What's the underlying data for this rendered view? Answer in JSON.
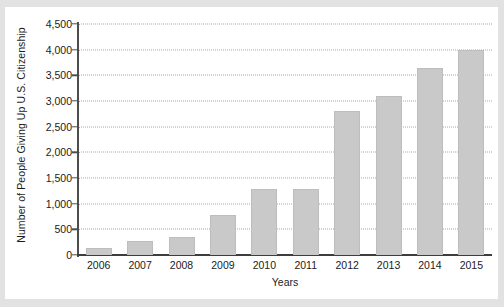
{
  "chart_data": {
    "type": "bar",
    "title": "",
    "xlabel": "Years",
    "ylabel": "Number of People Giving Up U.S. Citizenship",
    "categories": [
      "2006",
      "2007",
      "2008",
      "2009",
      "2010",
      "2011",
      "2012",
      "2013",
      "2014",
      "2015"
    ],
    "values": [
      130,
      270,
      350,
      780,
      1280,
      1280,
      2800,
      3100,
      3650,
      4000
    ],
    "ylim": [
      0,
      4500
    ],
    "yticks": [
      0,
      500,
      1000,
      1500,
      2000,
      2500,
      3000,
      3500,
      4000,
      4500
    ],
    "ytick_labels": [
      "0",
      "500",
      "1,000",
      "1,500",
      "2,000",
      "2,500",
      "3,000",
      "3,500",
      "4,000",
      "4,500"
    ],
    "grid": true,
    "grid_axis": "y",
    "grid_style": "dotted",
    "legend": false,
    "bar_color": "#c9c9c9",
    "axis_color": "#4d4d4d",
    "grid_color": "#a7a7a7",
    "background": "#ffffff"
  }
}
